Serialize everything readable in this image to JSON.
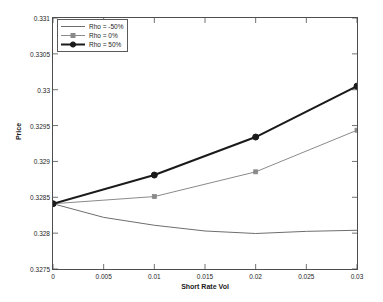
{
  "chart_data": {
    "type": "line",
    "title": "",
    "xlabel": "Short Rate Vol",
    "ylabel": "Price",
    "xlim": [
      0,
      0.03
    ],
    "ylim": [
      0.3275,
      0.331
    ],
    "xticks": [
      "0",
      "0.005",
      "0.01",
      "0.015",
      "0.02",
      "0.025",
      "0.03"
    ],
    "xtick_values": [
      0,
      0.005,
      0.01,
      0.015,
      0.02,
      0.025,
      0.03
    ],
    "yticks": [
      "0.3275",
      "0.328",
      "0.3285",
      "0.329",
      "0.3295",
      "0.33",
      "0.3305",
      "0.331"
    ],
    "ytick_values": [
      0.3275,
      0.328,
      0.3285,
      0.329,
      0.3295,
      0.33,
      0.3305,
      0.331
    ],
    "grid": false,
    "legend_position": "upper left",
    "series": [
      {
        "name": "Rho = -50%",
        "color": "#6e6e6e",
        "linewidth": 1,
        "marker": "none",
        "x": [
          0,
          0.005,
          0.01,
          0.015,
          0.02,
          0.025,
          0.03
        ],
        "values": [
          0.32841,
          0.32822,
          0.32811,
          0.32803,
          0.327995,
          0.328025,
          0.32804
        ]
      },
      {
        "name": "Rho = 0%",
        "color": "#8a8a8a",
        "linewidth": 1,
        "marker": "square",
        "x": [
          0,
          0.01,
          0.02,
          0.03
        ],
        "values": [
          0.32841,
          0.32851,
          0.328855,
          0.329435
        ]
      },
      {
        "name": "Rho = 50%",
        "color": "#1a1a1a",
        "linewidth": 2,
        "marker": "circle",
        "x": [
          0,
          0.01,
          0.02,
          0.03
        ],
        "values": [
          0.32841,
          0.32881,
          0.32934,
          0.33005
        ]
      }
    ]
  },
  "axes": {
    "x_label": "Short Rate Vol",
    "y_label": "Price",
    "frame_color": "#4d4d4d"
  },
  "legend": {
    "items": [
      {
        "label": "Rho = -50%"
      },
      {
        "label": "Rho = 0%"
      },
      {
        "label": "Rho = 50%"
      }
    ]
  }
}
